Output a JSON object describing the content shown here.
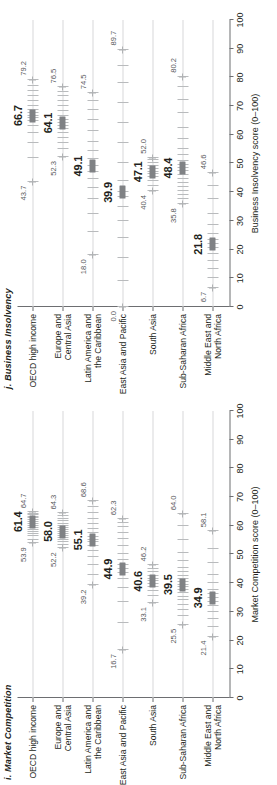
{
  "figure": {
    "orientation": "rotated-90",
    "panel_count": 2
  },
  "chart_data": [
    {
      "type": "scatter",
      "panel_id": "i",
      "title": "i. Market Competition",
      "xlabel": "Market Competition score (0–100)",
      "ylabel": "",
      "xlim": [
        0,
        100
      ],
      "xticks": [
        0,
        10,
        20,
        30,
        40,
        50,
        60,
        70,
        80,
        90,
        100
      ],
      "xticklabels": [
        "0",
        "10",
        "20",
        "30",
        "40",
        "50",
        "60",
        "70",
        "80",
        "90",
        "100"
      ],
      "grid": true,
      "legend": "none",
      "categories": [
        "OECD high income",
        "Europe and Central Asia",
        "Latin America and the Caribbean",
        "East Asia and Pacific",
        "South Asia",
        "Sub-Saharan Africa",
        "Middle East and North Africa"
      ],
      "category_lines": [
        [
          "OECD high income"
        ],
        [
          "Europe and",
          "Central Asia"
        ],
        [
          "Latin America and",
          "the Caribbean"
        ],
        [
          "East Asia and Pacific"
        ],
        [
          "South Asia"
        ],
        [
          "Sub-Saharan Africa"
        ],
        [
          "Middle East and",
          "North Africa"
        ]
      ],
      "series": [
        {
          "name": "Regional average",
          "values": [
            61.4,
            58.0,
            55.1,
            44.9,
            40.6,
            39.5,
            34.9
          ]
        },
        {
          "name": "Minimum",
          "values": [
            53.9,
            52.2,
            39.2,
            16.7,
            33.1,
            25.5,
            21.4
          ]
        },
        {
          "name": "Maximum",
          "values": [
            64.7,
            64.3,
            68.6,
            62.3,
            46.2,
            64.0,
            58.1
          ]
        }
      ],
      "mean_labels": [
        "61.4",
        "58.0",
        "55.1",
        "44.9",
        "40.6",
        "39.5",
        "34.9"
      ],
      "min_labels": [
        "53.9",
        "52.2",
        "39.2",
        "16.7",
        "33.1",
        "25.5",
        "21.4"
      ],
      "max_labels": [
        "64.7",
        "64.3",
        "68.6",
        "62.3",
        "46.2",
        "64.0",
        "58.1"
      ],
      "observations": [
        [
          53.9,
          55.2,
          56.4,
          57.1,
          58.0,
          58.6,
          59.4,
          60.1,
          60.8,
          61.4,
          62.0,
          62.6,
          63.2,
          63.8,
          64.2,
          64.7
        ],
        [
          52.2,
          53.4,
          54.3,
          55.1,
          55.9,
          56.6,
          57.3,
          58.0,
          58.7,
          59.3,
          60.0,
          60.8,
          61.6,
          62.4,
          63.3,
          64.3
        ],
        [
          39.2,
          43.0,
          46.5,
          49.1,
          51.3,
          53.0,
          54.4,
          55.1,
          56.2,
          57.4,
          58.9,
          60.5,
          62.4,
          64.6,
          66.5,
          68.6
        ],
        [
          16.7,
          26.0,
          33.5,
          38.2,
          41.4,
          43.5,
          44.9,
          46.3,
          48.0,
          50.2,
          52.8,
          55.4,
          57.6,
          59.5,
          61.0,
          62.3
        ],
        [
          33.1,
          35.4,
          37.2,
          38.6,
          39.8,
          40.6,
          41.5,
          42.6,
          43.8,
          45.0,
          46.2
        ],
        [
          25.5,
          28.4,
          30.6,
          32.4,
          34.0,
          35.3,
          36.5,
          37.6,
          38.6,
          39.5,
          40.4,
          41.4,
          42.5,
          43.8,
          45.4,
          47.6,
          50.6,
          55.0,
          60.0,
          64.0
        ],
        [
          21.4,
          24.8,
          27.6,
          30.0,
          32.0,
          33.6,
          34.9,
          36.2,
          37.8,
          40.0,
          43.0,
          47.0,
          52.0,
          58.1
        ]
      ]
    },
    {
      "type": "scatter",
      "panel_id": "j",
      "title": "j. Business Insolvency",
      "xlabel": "Business Insolvency score (0–100)",
      "ylabel": "",
      "xlim": [
        0,
        100
      ],
      "xticks": [
        0,
        10,
        20,
        30,
        40,
        50,
        60,
        70,
        80,
        90,
        100
      ],
      "xticklabels": [
        "0",
        "10",
        "20",
        "30",
        "40",
        "50",
        "60",
        "70",
        "80",
        "90",
        "100"
      ],
      "grid": true,
      "legend": "none",
      "categories": [
        "OECD high income",
        "Europe and Central Asia",
        "Latin America and the Caribbean",
        "East Asia and Pacific",
        "South Asia",
        "Sub-Saharan Africa",
        "Middle East and North Africa"
      ],
      "category_lines": [
        [
          "OECD high income"
        ],
        [
          "Europe and",
          "Central Asia"
        ],
        [
          "Latin America and",
          "the Caribbean"
        ],
        [
          "East Asia and Pacific"
        ],
        [
          "South Asia"
        ],
        [
          "Sub-Saharan Africa"
        ],
        [
          "Middle East and",
          "North Africa"
        ]
      ],
      "series": [
        {
          "name": "Regional average",
          "values": [
            66.7,
            64.1,
            49.1,
            39.9,
            47.1,
            48.4,
            21.8
          ]
        },
        {
          "name": "Minimum",
          "values": [
            43.7,
            52.3,
            18.0,
            0.0,
            40.4,
            35.8,
            6.7
          ]
        },
        {
          "name": "Maximum",
          "values": [
            79.2,
            76.5,
            74.5,
            89.7,
            52.0,
            80.2,
            46.6
          ]
        }
      ],
      "mean_labels": [
        "66.7",
        "64.1",
        "49.1",
        "39.9",
        "47.1",
        "48.4",
        "21.8"
      ],
      "min_labels": [
        "43.7",
        "52.3",
        "18.0",
        "0.0",
        "40.4",
        "35.8",
        "6.7"
      ],
      "max_labels": [
        "79.2",
        "76.5",
        "74.5",
        "89.7",
        "52.0",
        "80.2",
        "46.6"
      ],
      "observations": [
        [
          43.7,
          52.0,
          57.0,
          60.5,
          63.0,
          64.8,
          66.0,
          66.7,
          67.6,
          68.8,
          70.2,
          71.8,
          73.5,
          75.2,
          77.0,
          79.2
        ],
        [
          52.3,
          55.0,
          57.2,
          59.0,
          60.6,
          62.0,
          63.2,
          64.1,
          65.2,
          66.6,
          68.2,
          70.0,
          71.8,
          73.5,
          75.0,
          76.5
        ],
        [
          18.0,
          26.0,
          32.5,
          37.6,
          41.5,
          44.6,
          47.0,
          49.1,
          51.4,
          54.2,
          57.5,
          61.2,
          65.0,
          68.6,
          71.8,
          74.5
        ],
        [
          0.0,
          9.0,
          17.0,
          24.0,
          30.0,
          35.0,
          38.5,
          39.9,
          44.0,
          50.0,
          57.0,
          64.0,
          71.0,
          78.0,
          84.0,
          89.7
        ],
        [
          40.4,
          42.2,
          43.8,
          45.2,
          46.3,
          47.1,
          48.0,
          49.0,
          50.1,
          51.1,
          52.0
        ],
        [
          35.8,
          37.5,
          39.0,
          40.4,
          41.8,
          43.2,
          44.6,
          46.0,
          47.3,
          48.4,
          49.6,
          51.0,
          52.8,
          55.2,
          58.5,
          62.5,
          67.5,
          72.0,
          76.5,
          80.2
        ],
        [
          6.7,
          10.0,
          13.2,
          16.0,
          18.5,
          20.4,
          21.8,
          23.4,
          25.6,
          28.5,
          32.5,
          37.5,
          42.0,
          46.6
        ]
      ]
    }
  ]
}
